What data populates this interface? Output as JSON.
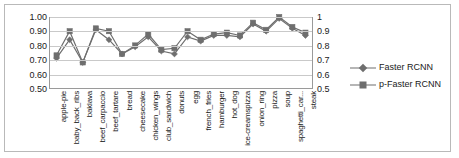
{
  "chart_data": {
    "type": "line",
    "title": "",
    "xlabel": "",
    "ylabel": "",
    "ylim": [
      0.5,
      1.0
    ],
    "grid": true,
    "legend_position": "right",
    "secondary_y_axis": true,
    "categories": [
      "apple-pie",
      "baby_back_ribs",
      "baklava",
      "beef_carpaccio",
      "beef_tartare",
      "bread",
      "cheesecake",
      "chicken_wings",
      "club_sandwich",
      "donuts",
      "egg",
      "french_fries",
      "hamburger",
      "hot_dog",
      "ice-creamspizza",
      "onion_ring",
      "pizza",
      "soup",
      "spaghetti_car...",
      "steak"
    ],
    "series": [
      {
        "name": "Faster RCNN",
        "marker": "diamond",
        "color": "#6e6e6e",
        "values": [
          0.71,
          0.84,
          0.68,
          0.91,
          0.84,
          0.74,
          0.79,
          0.86,
          0.76,
          0.74,
          0.86,
          0.83,
          0.87,
          0.87,
          0.86,
          0.95,
          0.9,
          0.99,
          0.92,
          0.87
        ]
      },
      {
        "name": "p-Faster RCNN",
        "marker": "square",
        "color": "#6e6e6e",
        "values": [
          0.73,
          0.9,
          0.68,
          0.92,
          0.9,
          0.74,
          0.8,
          0.88,
          0.77,
          0.78,
          0.9,
          0.84,
          0.88,
          0.89,
          0.87,
          0.96,
          0.91,
          1.0,
          0.93,
          0.89
        ]
      }
    ],
    "y_axis_left": {
      "ticks": [
        "1.00",
        "0.90",
        "0.80",
        "0.70",
        "0.60",
        "0.50"
      ],
      "values": [
        1.0,
        0.9,
        0.8,
        0.7,
        0.6,
        0.5
      ]
    },
    "y_axis_right": {
      "ticks": [
        "1",
        "0.9",
        "0.8",
        "0.7",
        "0.6",
        "0.5"
      ],
      "values": [
        1.0,
        0.9,
        0.8,
        0.7,
        0.6,
        0.5
      ]
    }
  },
  "legend": {
    "items": [
      {
        "label": "Faster RCNN"
      },
      {
        "label": "p-Faster RCNN"
      }
    ]
  }
}
